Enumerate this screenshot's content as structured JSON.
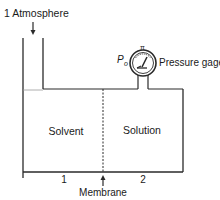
{
  "diagram": {
    "labels": {
      "atmosphere": "1 Atmosphere",
      "pressure_symbol": "P",
      "pressure_subscript": "o",
      "pressure_gage": "Pressure gage",
      "gauge_mark": "π",
      "left_compartment": "Solvent",
      "right_compartment": "Solution",
      "left_number": "1",
      "right_number": "2",
      "membrane": "Membrane"
    },
    "colors": {
      "line": "#2a2a2a",
      "liquid_line": "#9a9a9a",
      "background": "#ffffff"
    }
  }
}
